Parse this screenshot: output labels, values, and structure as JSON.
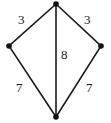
{
  "figure": {
    "type": "geometry-diagram",
    "shape_name": "kite",
    "canvas": {
      "width": 111,
      "height": 123
    },
    "colors": {
      "background": "#fefefe",
      "stroke": "#1a1a1a",
      "vertex_fill": "#111111",
      "label_text": "#1a1a1a"
    },
    "stroke_width": 1.6,
    "vertex_radius": 2.8,
    "vertices": [
      {
        "name": "top",
        "x": 56,
        "y": 4
      },
      {
        "name": "right",
        "x": 101,
        "y": 46
      },
      {
        "name": "bottom",
        "x": 56,
        "y": 117
      },
      {
        "name": "left",
        "x": 9,
        "y": 46
      }
    ],
    "edges": [
      {
        "name": "top-left-edge",
        "from": "top",
        "to": "left",
        "label": "3"
      },
      {
        "name": "top-right-edge",
        "from": "top",
        "to": "right",
        "label": "3"
      },
      {
        "name": "bottom-left-edge",
        "from": "left",
        "to": "bottom",
        "label": "7"
      },
      {
        "name": "bottom-right-edge",
        "from": "right",
        "to": "bottom",
        "label": "7"
      }
    ],
    "diagonals": [
      {
        "name": "vertical-diagonal",
        "from": "top",
        "to": "bottom",
        "label": "8"
      }
    ],
    "labels": {
      "top_left": "3",
      "top_right": "3",
      "diagonal": "8",
      "bottom_left": "7",
      "bottom_right": "7"
    }
  }
}
